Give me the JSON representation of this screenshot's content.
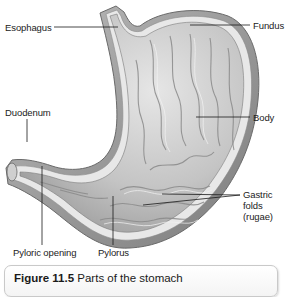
{
  "diagram": {
    "labels": [
      {
        "id": "esophagus",
        "text": "Esophagus"
      },
      {
        "id": "fundus",
        "text": "Fundus"
      },
      {
        "id": "body",
        "text": "Body"
      },
      {
        "id": "duodenum",
        "text": "Duodenum"
      },
      {
        "id": "gastric_folds",
        "text": "Gastric folds (rugae)",
        "lines": [
          "Gastric",
          "folds",
          "(rugae)"
        ]
      },
      {
        "id": "pyloric_opening",
        "text": "Pyloric opening"
      },
      {
        "id": "pylorus",
        "text": "Pylorus"
      }
    ],
    "colors": {
      "tissue_light": "#d9d9d9",
      "tissue_mid": "#a8a8a8",
      "tissue_dark": "#6e6e6e",
      "leader_line": "#1a1a1a",
      "caption_border": "#c9c9c9"
    }
  },
  "caption": {
    "figure_number": "Figure 11.5",
    "title": "Parts of the stomach"
  }
}
